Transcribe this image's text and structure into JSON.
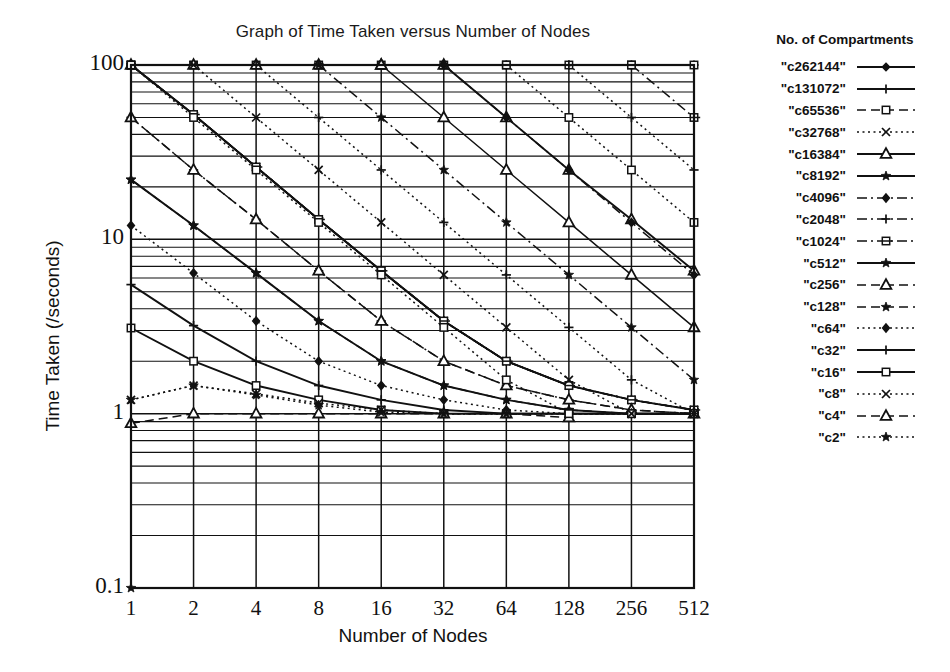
{
  "chart": {
    "title": "Graph of Time Taken versus Number of Nodes",
    "xlabel": "Number of Nodes",
    "ylabel": "Time Taken (/seconds)",
    "legend_title": "No. of Compartments"
  },
  "chart_data": {
    "type": "line",
    "title": "Graph of Time Taken versus Number of Nodes",
    "xlabel": "Number of Nodes",
    "ylabel": "Time Taken (/seconds)",
    "xscale": "log2",
    "yscale": "log10",
    "xlim": [
      1,
      512
    ],
    "ylim": [
      0.1,
      100
    ],
    "grid": true,
    "legend_position": "right",
    "legend_title": "No. of Compartments",
    "x": [
      1,
      2,
      4,
      8,
      16,
      32,
      64,
      128,
      256,
      512
    ],
    "xticks": [
      "1",
      "2",
      "4",
      "8",
      "16",
      "32",
      "64",
      "128",
      "256",
      "512"
    ],
    "yticks": [
      "0.1",
      "1",
      "10",
      "100"
    ],
    "series": [
      {
        "name": "\"c262144\"",
        "marker": "diamond",
        "dash": "solid",
        "x": [
          1,
          2,
          4,
          8,
          16,
          32,
          64,
          128
        ],
        "values": [
          100,
          52,
          26,
          13,
          6.6,
          3.4,
          2.0,
          1.45
        ]
      },
      {
        "name": "\"c131072\"",
        "marker": "plus",
        "dash": "solid",
        "x": [
          1,
          2,
          4,
          8,
          16,
          32,
          64,
          128,
          256,
          512
        ],
        "values": [
          100,
          100,
          100,
          100,
          100,
          100,
          100,
          100,
          100,
          100
        ]
      },
      {
        "name": "\"c65536\"",
        "marker": "square-open",
        "dash": "dash",
        "x": [
          1,
          2,
          4,
          8,
          16,
          32,
          64,
          128,
          256,
          512
        ],
        "values": [
          100,
          100,
          100,
          100,
          100,
          100,
          100,
          100,
          100,
          100
        ]
      },
      {
        "name": "\"c32768\"",
        "marker": "x",
        "dash": "dot",
        "x": [
          1,
          2,
          4,
          8,
          16,
          32,
          64,
          128,
          256,
          512
        ],
        "values": [
          100,
          52,
          26,
          13,
          6.6,
          3.4,
          2.0,
          1.45,
          1.2,
          1.05
        ]
      },
      {
        "name": "\"c16384\"",
        "marker": "triangle-open",
        "dash": "solid",
        "x": [
          1,
          2,
          4,
          8,
          16,
          32,
          64,
          128,
          256,
          512
        ],
        "values": [
          100,
          100,
          100,
          100,
          100,
          100,
          50,
          25,
          13,
          6.6
        ]
      },
      {
        "name": "\"c8192\"",
        "marker": "star",
        "dash": "solid",
        "x": [
          1,
          2,
          4,
          8,
          16,
          32,
          64,
          128,
          256,
          512
        ],
        "values": [
          100,
          52,
          26,
          13,
          6.6,
          3.4,
          2.0,
          1.45,
          1.2,
          1.05
        ]
      },
      {
        "name": "\"c4096\"",
        "marker": "diamond-filled",
        "dash": "dashdot",
        "x": [
          1,
          2,
          4,
          8,
          16,
          32,
          64,
          128,
          256,
          512
        ],
        "values": [
          100,
          52,
          26,
          13,
          6.6,
          3.4,
          2.0,
          1.45,
          1.2,
          1.05
        ]
      },
      {
        "name": "\"c2048\"",
        "marker": "plus",
        "dash": "dashdot",
        "x": [
          1,
          2,
          4,
          8,
          16,
          32,
          64,
          128,
          256,
          512
        ],
        "values": [
          50,
          25,
          13,
          6.6,
          3.4,
          2.0,
          1.45,
          1.2,
          1.05,
          1.0
        ]
      },
      {
        "name": "\"c1024\"",
        "marker": "square-bar",
        "dash": "dashdot",
        "x": [
          1,
          2,
          4,
          8,
          16,
          32,
          64,
          128,
          256,
          512
        ],
        "values": [
          100,
          52,
          26,
          13,
          6.6,
          3.4,
          2.0,
          1.45,
          1.2,
          1.05
        ]
      },
      {
        "name": "\"c512\"",
        "marker": "star",
        "dash": "solid",
        "x": [
          1,
          2,
          4,
          8,
          16,
          32,
          64,
          128,
          256,
          512
        ],
        "values": [
          22,
          12,
          6.4,
          3.4,
          2.0,
          1.45,
          1.2,
          1.05,
          1.0,
          1.0
        ]
      },
      {
        "name": "\"c256\"",
        "marker": "triangle-open",
        "dash": "dash",
        "x": [
          1,
          2,
          4,
          8,
          16,
          32,
          64,
          128,
          256,
          512
        ],
        "values": [
          50,
          25,
          13,
          6.6,
          3.4,
          2.0,
          1.45,
          1.2,
          1.05,
          1.0
        ]
      },
      {
        "name": "\"c128\"",
        "marker": "star",
        "dash": "dash",
        "x": [
          1,
          2,
          4,
          8,
          16,
          32,
          64,
          128,
          256,
          512
        ],
        "values": [
          22,
          12,
          6.4,
          3.4,
          2.0,
          1.45,
          1.2,
          1.05,
          1.0,
          1.0
        ]
      },
      {
        "name": "\"c64\"",
        "marker": "diamond-filled",
        "dash": "dot",
        "x": [
          1,
          2,
          4,
          8,
          16,
          32,
          64,
          128,
          256,
          512
        ],
        "values": [
          12,
          6.4,
          3.4,
          2.0,
          1.45,
          1.2,
          1.05,
          1.0,
          1.0,
          1.0
        ]
      },
      {
        "name": "\"c32\"",
        "marker": "plus",
        "dash": "solid",
        "x": [
          1,
          2,
          4,
          8,
          16,
          32,
          64,
          128,
          256,
          512
        ],
        "values": [
          5.5,
          3.2,
          2.0,
          1.45,
          1.2,
          1.05,
          1.0,
          1.0,
          1.0,
          1.0
        ]
      },
      {
        "name": "\"c16\"",
        "marker": "square-open",
        "dash": "solid",
        "x": [
          1,
          2,
          4,
          8,
          16,
          32,
          64,
          128,
          256,
          512
        ],
        "values": [
          3.1,
          2.0,
          1.45,
          1.2,
          1.05,
          1.0,
          1.0,
          1.0,
          1.0,
          1.0
        ]
      },
      {
        "name": "\"c8\"",
        "marker": "x",
        "dash": "dot",
        "x": [
          1,
          2,
          4,
          8,
          16,
          32,
          64,
          128,
          256,
          512
        ],
        "values": [
          1.2,
          1.45,
          1.3,
          1.15,
          1.05,
          1.0,
          1.0,
          1.0,
          1.0,
          1.0
        ]
      },
      {
        "name": "\"c4\"",
        "marker": "triangle-open",
        "dash": "dash",
        "x": [
          1,
          2,
          4,
          8,
          16,
          32,
          64,
          128
        ],
        "values": [
          0.88,
          1.0,
          1.0,
          1.0,
          1.0,
          1.0,
          1.0,
          0.95
        ]
      },
      {
        "name": "\"c2\"",
        "marker": "star",
        "dash": "dot",
        "x": [
          1,
          2,
          4,
          8,
          16,
          32,
          64,
          128,
          256,
          512
        ],
        "values": [
          1.2,
          1.45,
          1.28,
          1.12,
          1.02,
          1.0,
          1.0,
          1.0,
          1.0,
          1.0
        ]
      }
    ]
  },
  "colors": {
    "ink": "#111111",
    "background": "#ffffff"
  }
}
